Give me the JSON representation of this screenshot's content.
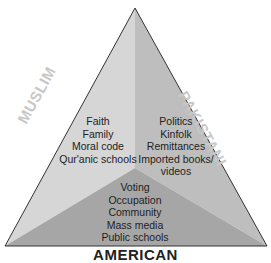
{
  "labels": {
    "left": "MUSLIM",
    "right": "PAKISTANI",
    "bottom": "AMERICAN"
  },
  "muslim_items": [
    "Faith",
    "Family",
    "Moral code",
    "Qur'anic schools"
  ],
  "pakistani_items": [
    "Politics",
    "Kinfolk",
    "Remittances",
    "Imported books/",
    "videos"
  ],
  "american_items": [
    "Voting",
    "Occupation",
    "Community",
    "Mass media",
    "Public schools"
  ],
  "colors": {
    "left_region": "#d4d4d4",
    "right_region": "#bdbdbd",
    "bottom_region": "#a4a4a4",
    "outline": "#333333"
  }
}
